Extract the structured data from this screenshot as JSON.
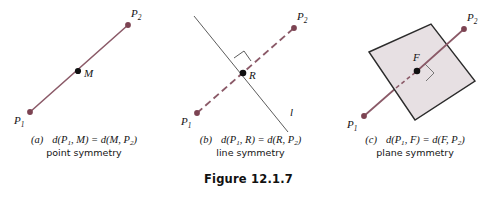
{
  "figure": {
    "title": "Figure 12.1.7",
    "colors": {
      "line": "#8b5a68",
      "line_dark": "#7c4c5c",
      "plane_fill": "#e7e0e3",
      "plane_stroke": "#2b2b2b",
      "point_marker": "#111111",
      "endpoint_marker": "#7c4352",
      "thin_line": "#4a4a4a",
      "text": "#141414"
    }
  },
  "panels": [
    {
      "id": "a",
      "letter": "(a)",
      "caption_math_parts": {
        "prefix": "d(P",
        "sub1": "1",
        "mid": ", M) = d(M, P",
        "sub2": "2",
        "suffix": ")"
      },
      "caption_math": "d(P1, M) = d(M, P2)",
      "caption_text": "point symmetry",
      "points": [
        {
          "name": "P1",
          "base": "P",
          "sub": "1",
          "x": 30,
          "y": 112,
          "kind": "endpoint"
        },
        {
          "name": "M",
          "base": "M",
          "sub": "",
          "x": 78,
          "y": 71,
          "kind": "midpoint"
        },
        {
          "name": "P2",
          "base": "P",
          "sub": "2",
          "x": 128,
          "y": 25,
          "kind": "endpoint"
        }
      ],
      "segment": {
        "x1": 30,
        "y1": 112,
        "x2": 128,
        "y2": 25,
        "style": "solid"
      }
    },
    {
      "id": "b",
      "letter": "(b)",
      "caption_math_parts": {
        "prefix": "d(P",
        "sub1": "1",
        "mid": ", R) = d(R, P",
        "sub2": "2",
        "suffix": ")"
      },
      "caption_math": "d(P1, R) = d(R, P2)",
      "caption_text": "line symmetry",
      "points": [
        {
          "name": "P1",
          "base": "P",
          "sub": "1",
          "x": 29,
          "y": 113,
          "kind": "endpoint"
        },
        {
          "name": "R",
          "base": "R",
          "sub": "",
          "x": 75,
          "y": 73,
          "kind": "midpoint"
        },
        {
          "name": "P2",
          "base": "P",
          "sub": "2",
          "x": 126,
          "y": 28,
          "kind": "endpoint"
        }
      ],
      "segment": {
        "x1": 29,
        "y1": 113,
        "x2": 126,
        "y2": 28,
        "style": "dashed"
      },
      "mirror_line": {
        "label": "l",
        "x1": 26,
        "y1": 16,
        "x2": 120,
        "y2": 132
      },
      "right_angle_marker": true
    },
    {
      "id": "c",
      "letter": "(c)",
      "caption_math_parts": {
        "prefix": "d(P",
        "sub1": "1",
        "mid": ", F) = d(F, P",
        "sub2": "2",
        "suffix": ")"
      },
      "caption_math": "d(P1, F) = d(F, P2)",
      "caption_text": "plane symmetry",
      "points": [
        {
          "name": "P1",
          "base": "P",
          "sub": "1",
          "x": 31,
          "y": 116,
          "kind": "endpoint"
        },
        {
          "name": "F",
          "base": "F",
          "sub": "",
          "x": 84,
          "y": 71,
          "kind": "midpoint"
        },
        {
          "name": "P2",
          "base": "P",
          "sub": "2",
          "x": 131,
          "y": 29,
          "kind": "endpoint"
        }
      ],
      "segment": {
        "x1": 31,
        "y1": 116,
        "x2": 131,
        "y2": 29,
        "style": "solid-with-hidden"
      },
      "plane": {
        "name": "plane-F",
        "vertices": [
          [
            36,
            52
          ],
          [
            98,
            24
          ],
          [
            142,
            81
          ],
          [
            82,
            120
          ]
        ]
      },
      "right_angle_marker": true
    }
  ]
}
